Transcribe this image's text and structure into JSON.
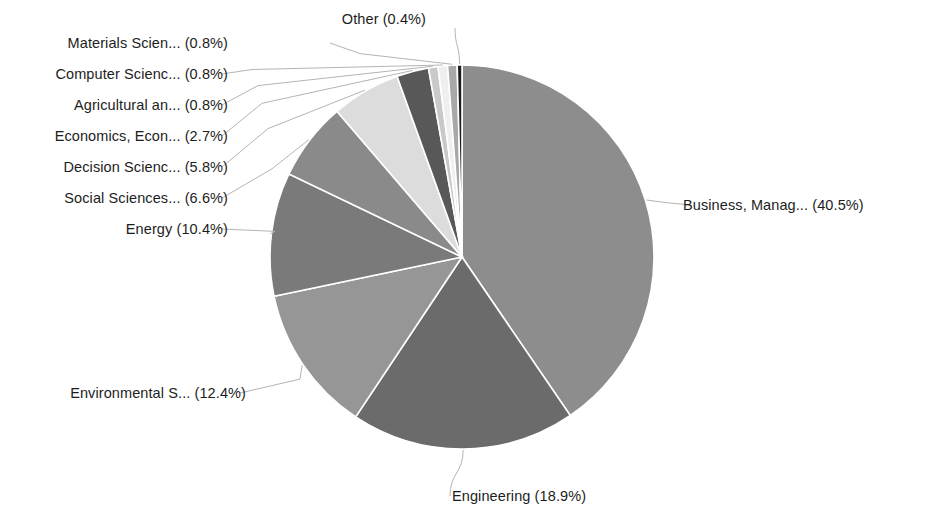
{
  "chart_data": {
    "type": "pie",
    "title": "",
    "legend_position": "callout-labels",
    "units": "percent",
    "start_angle_deg": 0,
    "direction": "clockwise",
    "categories": [
      "Business, Manag...",
      "Engineering",
      "Environmental S...",
      "Energy",
      "Social Sciences...",
      "Decision Scienc...",
      "Economics, Econ...",
      "Agricultural an...",
      "Computer Scienc...",
      "Materials Scien...",
      "Other"
    ],
    "values": [
      40.5,
      18.9,
      12.4,
      10.4,
      6.6,
      5.8,
      2.7,
      0.8,
      0.8,
      0.8,
      0.4
    ],
    "colors": [
      "#8d8d8d",
      "#6b6b6b",
      "#969696",
      "#7a7a7a",
      "#8a8a8a",
      "#dcdcdc",
      "#585858",
      "#c9c9c9",
      "#efefef",
      "#a8a8a8",
      "#1c1c1c"
    ],
    "slices": [
      {
        "label": "Business, Manag... (40.5%)",
        "name": "Business, Manag...",
        "value": 40.5,
        "color": "#8d8d8d"
      },
      {
        "label": "Engineering (18.9%)",
        "name": "Engineering",
        "value": 18.9,
        "color": "#6b6b6b"
      },
      {
        "label": "Environmental S... (12.4%)",
        "name": "Environmental S...",
        "value": 12.4,
        "color": "#969696"
      },
      {
        "label": "Energy (10.4%)",
        "name": "Energy",
        "value": 10.4,
        "color": "#7a7a7a"
      },
      {
        "label": "Social Sciences... (6.6%)",
        "name": "Social Sciences...",
        "value": 6.6,
        "color": "#8a8a8a"
      },
      {
        "label": "Decision Scienc... (5.8%)",
        "name": "Decision Scienc...",
        "value": 5.8,
        "color": "#dcdcdc"
      },
      {
        "label": "Economics, Econ... (2.7%)",
        "name": "Economics, Econ...",
        "value": 2.7,
        "color": "#585858"
      },
      {
        "label": "Agricultural an... (0.8%)",
        "name": "Agricultural an...",
        "value": 0.8,
        "color": "#c9c9c9"
      },
      {
        "label": "Computer Scienc... (0.8%)",
        "name": "Computer Scienc...",
        "value": 0.8,
        "color": "#efefef"
      },
      {
        "label": "Materials Scien... (0.8%)",
        "name": "Materials Scien...",
        "value": 0.8,
        "color": "#a8a8a8"
      },
      {
        "label": "Other (0.4%)",
        "name": "Other",
        "value": 0.4,
        "color": "#1c1c1c"
      }
    ]
  },
  "geometry": {
    "cx": 462,
    "cy": 257,
    "r": 192
  },
  "labels": {
    "business": "Business, Manag... (40.5%)",
    "engineering": "Engineering (18.9%)",
    "environmental": "Environmental S... (12.4%)",
    "energy": "Energy (10.4%)",
    "social_sciences": "Social Sciences... (6.6%)",
    "decision_sciences": "Decision Scienc... (5.8%)",
    "economics": "Economics, Econ... (2.7%)",
    "agricultural": "Agricultural an... (0.8%)",
    "computer_science": "Computer Scienc... (0.8%)",
    "materials_science": "Materials Scien... (0.8%)",
    "other": "Other (0.4%)"
  }
}
